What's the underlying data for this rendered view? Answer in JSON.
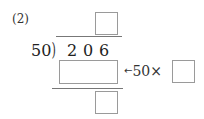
{
  "problem": {
    "label": "(2)",
    "divisor": "50",
    "dividend_digits": [
      "2",
      "0",
      "6"
    ],
    "bracket_glyph": ")",
    "arrow_glyph": "←",
    "hint_text": "50×",
    "boxes": {
      "quotient": "",
      "product": "",
      "multiplier": "",
      "remainder": ""
    }
  }
}
